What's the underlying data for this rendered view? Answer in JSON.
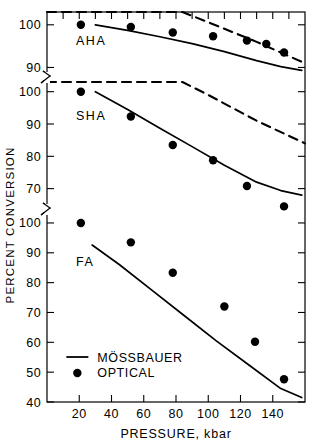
{
  "chart_data": {
    "type": "scatter",
    "title": "",
    "xlabel": "PRESSURE,  kbar",
    "ylabel": "PERCENT CONVERSION",
    "xlim": [
      0,
      160
    ],
    "xticks": [
      20,
      40,
      60,
      80,
      100,
      120,
      140
    ],
    "xticklabels": [
      "20",
      "40",
      "60",
      "80",
      "100",
      "120",
      "140"
    ],
    "grid": false,
    "legend_position": "lower-left-inside",
    "legend": [
      {
        "label": "MÖSSBAUER",
        "marker": "line",
        "style": "solid"
      },
      {
        "label": "OPTICAL",
        "marker": "circle",
        "style": "filled"
      }
    ],
    "broken_axis": true,
    "panels": [
      {
        "name": "AHA",
        "label": "AHA",
        "ylim": [
          88,
          103
        ],
        "yticks": [
          90,
          100
        ],
        "yticklabels": [
          "90",
          "100"
        ],
        "series": [
          {
            "name": "OPTICAL",
            "type": "scatter",
            "x": [
              21,
              52,
              78,
              103,
              124,
              136,
              147
            ],
            "y": [
              100.0,
              99.5,
              98.2,
              97.3,
              96.3,
              95.5,
              93.5
            ]
          },
          {
            "name": "MÖSSBAUER",
            "type": "line",
            "style": "solid",
            "x": [
              30,
              50,
              70,
              90,
              110,
              130,
              145,
              158
            ],
            "y": [
              100.0,
              98.7,
              97.2,
              95.6,
              93.7,
              91.6,
              90.2,
              89.3
            ]
          },
          {
            "name": "SHA-overlay",
            "type": "line",
            "style": "dashed",
            "x": [
              0,
              84,
              100,
              130,
              160
            ],
            "y": [
              103.0,
              103.0,
              100.6,
              96.0,
              91.0
            ]
          }
        ]
      },
      {
        "name": "SHA",
        "label": "SHA",
        "ylim": [
          64,
          103
        ],
        "yticks": [
          70,
          80,
          90,
          100
        ],
        "yticklabels": [
          "70",
          "80",
          "90",
          "100"
        ],
        "series": [
          {
            "name": "OPTICAL",
            "type": "scatter",
            "x": [
              21,
              52,
              78,
              103,
              124,
              147
            ],
            "y": [
              100.0,
              92.3,
              83.5,
              78.8,
              70.8,
              64.5
            ]
          },
          {
            "name": "MÖSSBAUER",
            "type": "line",
            "style": "solid",
            "x": [
              30,
              50,
              70,
              90,
              110,
              130,
              145,
              158
            ],
            "y": [
              100.0,
              94.5,
              88.7,
              83.0,
              77.2,
              72.0,
              69.4,
              68.0
            ]
          },
          {
            "name": "FA-overlay",
            "type": "line",
            "style": "dashed",
            "x": [
              0,
              84,
              100,
              130,
              160
            ],
            "y": [
              103.0,
              103.0,
              99.0,
              91.0,
              84.0
            ]
          }
        ]
      },
      {
        "name": "FA",
        "label": "FA",
        "ylim": [
          40,
          103
        ],
        "yticks": [
          40,
          50,
          60,
          70,
          80,
          90,
          100
        ],
        "yticklabels": [
          "40",
          "50",
          "60",
          "70",
          "80",
          "90",
          "100"
        ],
        "series": [
          {
            "name": "OPTICAL",
            "type": "scatter",
            "x": [
              21,
              52,
              78,
              110,
              129,
              147
            ],
            "y": [
              100.0,
              93.5,
              83.3,
              72.0,
              60.2,
              47.6
            ]
          },
          {
            "name": "MÖSSBAUER",
            "type": "line",
            "style": "solid",
            "x": [
              28,
              45,
              65,
              85,
              105,
              125,
              145,
              158
            ],
            "y": [
              92.6,
              86.0,
              77.5,
              69.0,
              60.5,
              52.5,
              44.5,
              41.5
            ]
          }
        ]
      }
    ]
  }
}
